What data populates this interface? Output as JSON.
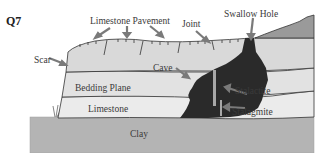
{
  "question": {
    "number": "Q7"
  },
  "diagram": {
    "labels": {
      "limestone_pavement": "Limestone Pavement",
      "joint": "Joint",
      "swallow_hole": "Swallow Hole",
      "scar": "Scar",
      "cave": "Cave",
      "bedding_plane": "Bedding Plane",
      "stalactite": "Stalactite",
      "limestone": "Limestone",
      "stalagmite": "Stalagmite",
      "clay": "Clay"
    },
    "colors": {
      "limestone": "#e4e4e4",
      "limestone_mid": "#d6d6d6",
      "clay": "#b4b4b4",
      "cave": "#2a2a2a",
      "hill": "#9a9a9a",
      "arrow": "#7a7a7a",
      "outline": "#333333"
    }
  }
}
